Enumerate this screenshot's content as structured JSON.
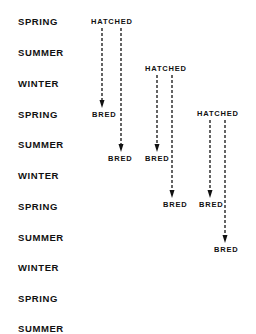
{
  "diagram": {
    "seasons": [
      "SPRING",
      "SUMMER",
      "WINTER",
      "SPRING",
      "SUMMER",
      "WINTER",
      "SPRING",
      "SUMMER",
      "WINTER",
      "SPRING",
      "SUMMER"
    ],
    "cohorts": [
      {
        "start_label": "HATCHED",
        "end_labels": [
          "BRED",
          "BRED"
        ],
        "start_season_index": 0,
        "end_season_indices": [
          3,
          4
        ]
      },
      {
        "start_label": "HATCHED",
        "end_labels": [
          "BRED",
          "BRED"
        ],
        "start_season_index": 1.5,
        "end_season_indices": [
          4.5,
          6
        ]
      },
      {
        "start_label": "HATCHED",
        "end_labels": [
          "BRED",
          "BRED"
        ],
        "start_season_index": 3,
        "end_season_indices": [
          6,
          7.5
        ]
      }
    ],
    "line_style": "dashed-arrow",
    "text_color": "#111111",
    "background": "#ffffff"
  }
}
